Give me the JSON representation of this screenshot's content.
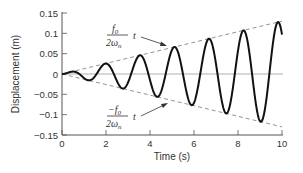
{
  "chart_data": {
    "type": "line",
    "title": "",
    "xlabel": "Time (s)",
    "ylabel": "Displacement (m)",
    "xlim": [
      0,
      10
    ],
    "ylim": [
      -0.15,
      0.15
    ],
    "xticks": [
      0,
      2,
      4,
      6,
      8,
      10
    ],
    "xtick_labels": [
      "0",
      "2",
      "4",
      "6",
      "8",
      "10"
    ],
    "yticks": [
      0.15,
      0.1,
      0.05,
      0,
      -0.05,
      -0.1,
      -0.15
    ],
    "ytick_labels": [
      "0.15",
      "0.1",
      "0.05",
      "0",
      "−0.05",
      "−0.1",
      "−0.15"
    ],
    "grid": false,
    "series": [
      {
        "name": "response",
        "style": "solid",
        "formula": "x(t) = (f0/(2*wn)) * t * sin(wn*t)",
        "slope": 0.013,
        "omega_n": 4.0,
        "peaks": [
          {
            "t": 0.39,
            "x": 0.005
          },
          {
            "t": 1.96,
            "x": 0.025
          },
          {
            "t": 3.53,
            "x": 0.046
          },
          {
            "t": 5.1,
            "x": 0.066
          },
          {
            "t": 6.68,
            "x": 0.087
          },
          {
            "t": 8.25,
            "x": 0.107
          },
          {
            "t": 9.82,
            "x": 0.128
          }
        ],
        "troughs": [
          {
            "t": 1.18,
            "x": -0.015
          },
          {
            "t": 2.75,
            "x": -0.036
          },
          {
            "t": 4.32,
            "x": -0.056
          },
          {
            "t": 5.89,
            "x": -0.077
          },
          {
            "t": 7.46,
            "x": -0.097
          },
          {
            "t": 9.03,
            "x": -0.117
          }
        ]
      },
      {
        "name": "upper envelope",
        "style": "dashed",
        "x": [
          0,
          10
        ],
        "y": [
          0,
          0.13
        ]
      },
      {
        "name": "lower envelope",
        "style": "dashed",
        "x": [
          0,
          10
        ],
        "y": [
          0,
          -0.13
        ]
      }
    ],
    "annotations": [
      {
        "text_num": "f0",
        "text_den": "2ωn",
        "suffix": "t",
        "target": "upper envelope"
      },
      {
        "text_num": "−f0",
        "text_den": "2ωn",
        "suffix": "t",
        "target": "lower envelope"
      }
    ]
  },
  "labels": {
    "xlabel": "Time (s)",
    "ylabel": "Displacement (m)",
    "upper_num": "f",
    "upper_num_sub": "0",
    "upper_den": "2ω",
    "upper_den_sub": "n",
    "lower_num": "−f",
    "lower_num_sub": "0",
    "lower_den": "2ω",
    "lower_den_sub": "n",
    "t": "t"
  }
}
